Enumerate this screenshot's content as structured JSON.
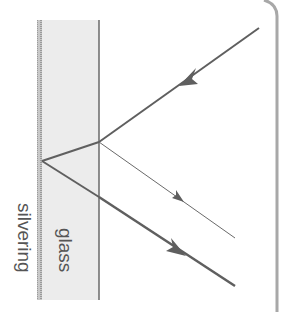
{
  "diagram": {
    "labels": {
      "silvering": "silvering",
      "glass": "glass"
    },
    "colors": {
      "ray": "#5f5f5f",
      "glass_fill": "#ececec",
      "glass_edge": "#6a6a6a",
      "silvering": "#a0a0a0",
      "frame": "#a8a8a8",
      "label": "#555555"
    },
    "geometry": {
      "glass": {
        "x_left": 40,
        "x_right": 99,
        "y_top": 20,
        "y_bottom": 300
      },
      "incident_ray": {
        "from": [
          259,
          28
        ],
        "to": [
          99,
          142
        ],
        "arrow_at": [
          186,
          80
        ]
      },
      "front_surface_reflection": {
        "from": [
          99,
          142
        ],
        "to": [
          235,
          238
        ],
        "arrow_at": [
          180,
          199
        ]
      },
      "refracted_in_glass": {
        "from": [
          99,
          142
        ],
        "to": [
          42,
          161
        ]
      },
      "reflected_in_glass": {
        "from": [
          42,
          161
        ],
        "to": [
          99,
          197
        ]
      },
      "main_reflected_ray": {
        "from": [
          99,
          197
        ],
        "to": [
          235,
          286
        ],
        "arrow_at": [
          178,
          249
        ]
      },
      "frame": {
        "x": 277,
        "y_top": 0,
        "y_bottom": 312
      }
    }
  }
}
